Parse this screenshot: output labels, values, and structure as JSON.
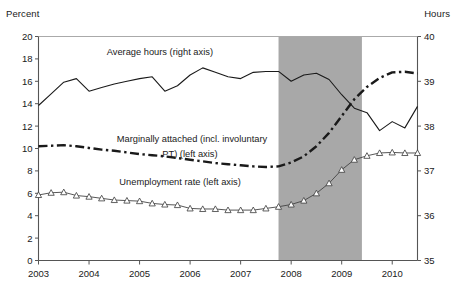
{
  "chart_data": {
    "type": "line",
    "title": "",
    "subtitle": "",
    "xlabel": "",
    "ylabel": "Percent",
    "ylabel_right": "Hours",
    "ylim": [
      0,
      20
    ],
    "ylim_right": [
      35,
      40
    ],
    "xlim": [
      2003.0,
      2010.5
    ],
    "grid": false,
    "legend_position": "inline-annotations",
    "yticks": [
      0,
      2,
      4,
      6,
      8,
      10,
      12,
      14,
      16,
      18,
      20
    ],
    "yticks_right": [
      35,
      36,
      37,
      38,
      39,
      40
    ],
    "xticks": [
      2003,
      2004,
      2005,
      2006,
      2007,
      2008,
      2009,
      2010
    ],
    "xtick_labels": [
      "2003",
      "2004",
      "2005",
      "2006",
      "2007",
      "2008",
      "2009",
      "2010"
    ],
    "shaded_region": {
      "label": "recession",
      "start": 2007.75,
      "end": 2009.4,
      "color": "#a8a8a8"
    },
    "annotations": [
      {
        "text": "Average hours (right axis)",
        "x": 2004.35,
        "y_percent": 18.35
      },
      {
        "text": "Marginally attached (incl. involuntary",
        "x": 2004.55,
        "y_percent": 10.55
      },
      {
        "text": "PT) (left axis)",
        "x": 2005.45,
        "y_percent": 9.25
      },
      {
        "text": "Unemployment rate (left axis)",
        "x": 2004.6,
        "y_percent": 6.75
      }
    ],
    "series": [
      {
        "name": "Average hours (right axis)",
        "axis": "right",
        "style": "solid",
        "color": "#1a1a1a",
        "marker": "none",
        "x": [
          2003.0,
          2003.25,
          2003.5,
          2003.75,
          2004.0,
          2004.25,
          2004.5,
          2004.75,
          2005.0,
          2005.25,
          2005.5,
          2005.75,
          2006.0,
          2006.25,
          2006.5,
          2006.75,
          2007.0,
          2007.25,
          2007.5,
          2007.75,
          2008.0,
          2008.25,
          2008.5,
          2008.75,
          2009.0,
          2009.25,
          2009.5,
          2009.75,
          2010.0,
          2010.25,
          2010.5
        ],
        "values": [
          38.46,
          38.72,
          38.98,
          39.06,
          38.78,
          38.86,
          38.94,
          39.0,
          39.06,
          39.1,
          38.78,
          38.9,
          39.14,
          39.3,
          39.2,
          39.1,
          39.06,
          39.2,
          39.22,
          39.22,
          39.0,
          39.14,
          39.18,
          39.04,
          38.7,
          38.4,
          38.3,
          37.9,
          38.1,
          37.96,
          38.44
        ]
      },
      {
        "name": "Marginally attached (incl. involuntary PT) (left axis)",
        "axis": "left",
        "style": "dashdot",
        "color": "#1a1a1a",
        "marker": "none",
        "x": [
          2003.0,
          2003.25,
          2003.5,
          2003.75,
          2004.0,
          2004.25,
          2004.5,
          2004.75,
          2005.0,
          2005.25,
          2005.5,
          2005.75,
          2006.0,
          2006.25,
          2006.5,
          2006.75,
          2007.0,
          2007.25,
          2007.5,
          2007.75,
          2008.0,
          2008.25,
          2008.5,
          2008.75,
          2009.0,
          2009.25,
          2009.5,
          2009.75,
          2010.0,
          2010.25,
          2010.5
        ],
        "values": [
          10.2,
          10.25,
          10.3,
          10.2,
          10.05,
          9.9,
          9.8,
          9.65,
          9.5,
          9.4,
          9.3,
          9.15,
          9.0,
          8.85,
          8.7,
          8.6,
          8.5,
          8.4,
          8.35,
          8.4,
          8.75,
          9.3,
          10.2,
          11.4,
          12.9,
          14.4,
          15.5,
          16.3,
          16.8,
          16.85,
          16.7
        ]
      },
      {
        "name": "Unemployment rate (left axis)",
        "axis": "left",
        "style": "solid-thin",
        "color": "#444444",
        "marker": "triangle-up",
        "x": [
          2003.0,
          2003.25,
          2003.5,
          2003.75,
          2004.0,
          2004.25,
          2004.5,
          2004.75,
          2005.0,
          2005.25,
          2005.5,
          2005.75,
          2006.0,
          2006.25,
          2006.5,
          2006.75,
          2007.0,
          2007.25,
          2007.5,
          2007.75,
          2008.0,
          2008.25,
          2008.5,
          2008.75,
          2009.0,
          2009.25,
          2009.5,
          2009.75,
          2010.0,
          2010.25,
          2010.5
        ],
        "values": [
          5.85,
          6.05,
          6.1,
          5.8,
          5.7,
          5.55,
          5.4,
          5.35,
          5.3,
          5.1,
          5.0,
          4.95,
          4.65,
          4.6,
          4.6,
          4.5,
          4.5,
          4.5,
          4.65,
          4.8,
          5.0,
          5.35,
          6.0,
          6.9,
          8.1,
          9.0,
          9.35,
          9.6,
          9.65,
          9.6,
          9.6
        ]
      }
    ]
  }
}
